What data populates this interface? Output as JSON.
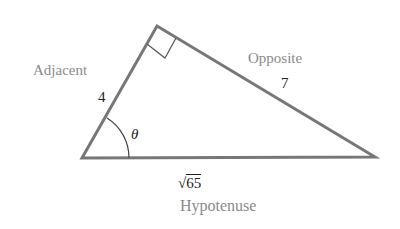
{
  "diagram": {
    "type": "right-triangle",
    "vertices": {
      "angle_vertex": [
        82,
        158
      ],
      "right_angle_vertex": [
        157,
        26
      ],
      "far_vertex": [
        375,
        157
      ]
    },
    "line_color": "#777777",
    "label_color": "#8a8a8a",
    "value_color": "#222222",
    "sides": {
      "adjacent": {
        "name": "Adjacent",
        "value": "4"
      },
      "opposite": {
        "name": "Opposite",
        "value": "7"
      },
      "hypotenuse": {
        "name": "Hypotenuse",
        "value_radicand": "65",
        "value_symbol": "√"
      }
    },
    "angle_label": "θ"
  }
}
